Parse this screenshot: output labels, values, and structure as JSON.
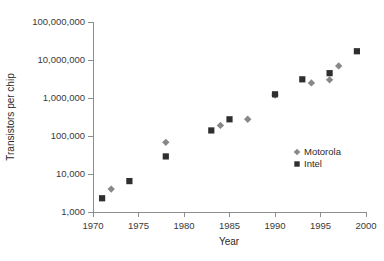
{
  "chart_data": {
    "type": "scatter",
    "title": "",
    "xlabel": "Year",
    "ylabel": "Transistors per chip",
    "xlim": [
      1970,
      2000
    ],
    "ylim": [
      1000,
      100000000
    ],
    "yscale": "log",
    "grid": false,
    "legend_position": "right-middle",
    "x_ticks": [
      1970,
      1975,
      1980,
      1985,
      1990,
      1995,
      2000
    ],
    "x_tick_labels": [
      "1970",
      "1975",
      "1980",
      "1985",
      "1990",
      "1995",
      "2000"
    ],
    "y_ticks": [
      1000,
      10000,
      100000,
      1000000,
      10000000,
      100000000
    ],
    "y_tick_labels": [
      "1,000",
      "10,000",
      "100,000",
      "1,000,000",
      "10,000,000",
      "100,000,000"
    ],
    "series": [
      {
        "name": "Motorola",
        "marker": "diamond",
        "color": "#888888",
        "points": [
          {
            "x": 1972,
            "y": 4000
          },
          {
            "x": 1978,
            "y": 68000
          },
          {
            "x": 1984,
            "y": 190000
          },
          {
            "x": 1987,
            "y": 275000
          },
          {
            "x": 1990,
            "y": 1200000
          },
          {
            "x": 1994,
            "y": 2500000
          },
          {
            "x": 1996,
            "y": 3000000
          },
          {
            "x": 1997,
            "y": 7000000
          }
        ]
      },
      {
        "name": "Intel",
        "marker": "square",
        "color": "#2f2f2f",
        "points": [
          {
            "x": 1971,
            "y": 2300
          },
          {
            "x": 1974,
            "y": 6500
          },
          {
            "x": 1978,
            "y": 29000
          },
          {
            "x": 1983,
            "y": 140000
          },
          {
            "x": 1985,
            "y": 275000
          },
          {
            "x": 1990,
            "y": 1250000
          },
          {
            "x": 1993,
            "y": 3100000
          },
          {
            "x": 1996,
            "y": 4500000
          },
          {
            "x": 1999,
            "y": 17000000
          }
        ]
      }
    ]
  },
  "legend": {
    "entries": [
      {
        "label": "Motorola",
        "marker": "diamond"
      },
      {
        "label": "Intel",
        "marker": "square"
      }
    ]
  },
  "colors": {
    "intel": "#2f2f2f",
    "motorola": "#888888",
    "axis": "#8d8d8d",
    "text": "#2b2b2b",
    "background": "#ffffff"
  }
}
